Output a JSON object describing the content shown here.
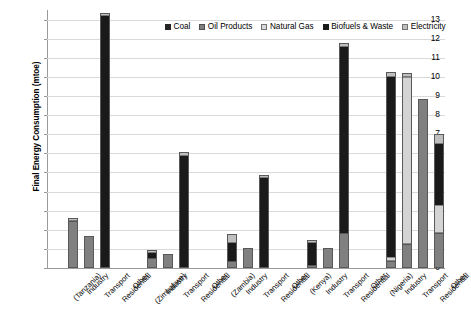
{
  "chart_data": {
    "type": "bar",
    "title": "",
    "subtitle": "",
    "xlabel": "",
    "ylabel": "Final Energy Consumption (mtoe)",
    "ylim": [
      0,
      13.5
    ],
    "ytick_labels": [
      "0",
      "1",
      "2",
      "3",
      "4",
      "5",
      "6",
      "7",
      "8",
      "9",
      "10",
      "11",
      "12",
      "13"
    ],
    "grid": true,
    "stacked": true,
    "legend_position": "top-right",
    "legend": [
      {
        "name": "Coal",
        "color": "#262626"
      },
      {
        "name": "Oil Products",
        "color": "#808080"
      },
      {
        "name": "Natural Gas",
        "color": "#d9d9d9"
      },
      {
        "name": "Biofuels & Waste",
        "color": "#1a1a1a"
      },
      {
        "name": "Electricity",
        "color": "#bfbfbf"
      }
    ],
    "series": [
      {
        "name": "Coal",
        "values": [
          0,
          0,
          0,
          0,
          0,
          0,
          0,
          0,
          0,
          0,
          0,
          0,
          0,
          0,
          0,
          0,
          0,
          0,
          0,
          0,
          0,
          0,
          0,
          0,
          0
        ]
      },
      {
        "name": "Oil Products",
        "values": [
          0,
          2.45,
          1.65,
          0,
          0,
          0,
          0.55,
          0.75,
          0,
          0,
          0,
          0.35,
          1.05,
          0,
          0,
          0,
          0.15,
          1.05,
          1.85,
          0,
          0,
          0.35,
          1.25,
          8.85,
          1.85
        ]
      },
      {
        "name": "Natural Gas",
        "values": [
          0,
          0,
          0,
          0,
          0,
          0,
          0,
          0,
          0,
          0,
          0,
          0,
          0,
          0,
          0,
          0,
          0,
          0,
          0,
          0,
          0,
          0.25,
          8.75,
          0,
          1.45
        ]
      },
      {
        "name": "Biofuels & Waste",
        "values": [
          0,
          0,
          0,
          13.2,
          0,
          0,
          0.25,
          0,
          5.85,
          0,
          0,
          0.95,
          0,
          4.7,
          0,
          0,
          1.15,
          0,
          9.7,
          0,
          0,
          9.4,
          0,
          0,
          3.2
        ]
      },
      {
        "name": "Electricity",
        "values": [
          0,
          0.15,
          0,
          0.15,
          0,
          0,
          0.15,
          0,
          0.2,
          0,
          0,
          0.5,
          0,
          0.15,
          0,
          0,
          0.15,
          0,
          0.25,
          0,
          0,
          0.25,
          0.2,
          0,
          0.5
        ]
      }
    ],
    "group_totals": [
      0,
      2.6,
      1.65,
      13.35,
      0,
      0,
      0.95,
      0.75,
      6.05,
      0,
      0,
      1.8,
      1.05,
      4.85,
      0,
      0,
      1.45,
      1.05,
      11.8,
      0,
      0,
      10.25,
      10.2,
      8.85,
      7.0
    ],
    "categories": [
      "(Tanzania)",
      "Industry",
      "Transport",
      "Residential",
      "Other",
      "(Zimbabwe)",
      "Industry",
      "Transport",
      "Residential",
      "Other",
      "(Zambia)",
      "Industry",
      "Transport",
      "Residential",
      "Other",
      "(Kenya)",
      "Industry",
      "Transport",
      "Residential",
      "Other",
      "(Nigeria)",
      "Industry",
      "Transport",
      "Residential",
      "Other"
    ],
    "annotations": [
      {
        "text": "No data",
        "category": "Residential",
        "group": "(Nigeria)",
        "orientation": "vertical"
      }
    ],
    "countries": [
      "Tanzania",
      "Zimbabwe",
      "Zambia",
      "Kenya",
      "Nigeria"
    ],
    "sectors": [
      "Industry",
      "Transport",
      "Residential",
      "Other"
    ]
  }
}
